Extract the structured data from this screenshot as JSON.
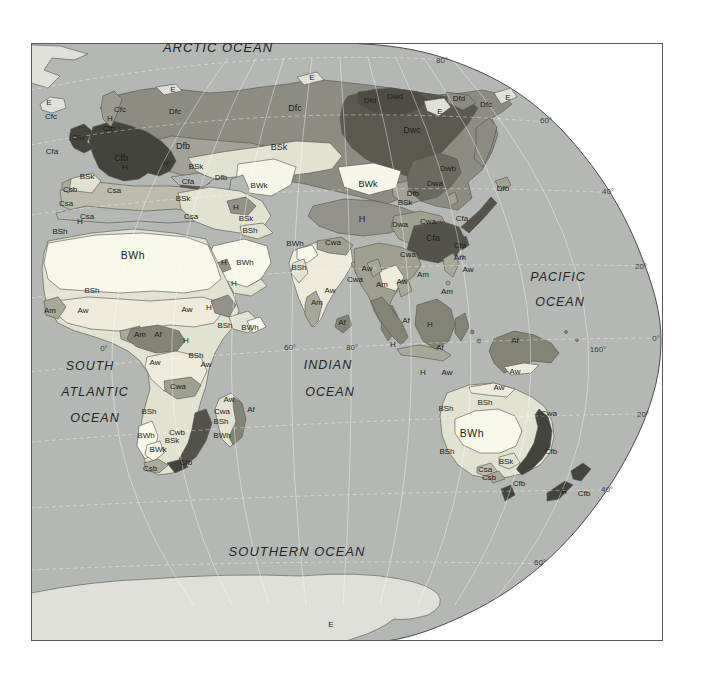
{
  "map": {
    "title_semantic": "Koppen climate classification map, Eastern Hemisphere oval projection",
    "colors": {
      "page_background": "#ffffff",
      "frame_border": "#5a5a5a",
      "graticule": "#ffffff",
      "boundary_line": "#55504a"
    },
    "zone_colors": {
      "ocean": "#b4b8b4",
      "E": "#e0e0da",
      "BWh": "#f7f7ea",
      "BWk": "#f5f5e8",
      "BSh": "#e2e2d0",
      "BSk": "#e2e2d0",
      "Aw": "#eeebdb",
      "Am": "#a8a899",
      "Af": "#848476",
      "Cwa": "#a0a090",
      "Cwb": "#a0a090",
      "Cfa": "#53534b",
      "Cfb": "#44443e",
      "Cfc": "#9a9a8e",
      "Csa": "#bdbcac",
      "Csb": "#acab9b",
      "Dfb": "#a3a299",
      "Dfc": "#8d8c83",
      "Dfd": "#8d8c83",
      "Dwa": "#6c6a60",
      "Dwb": "#6c6a60",
      "Dwc": "#5b594f",
      "Dwd": "#4e4c44",
      "H": "#92928a"
    },
    "ocean_labels": [
      {
        "t": "ARCTIC OCEAN",
        "x": 218,
        "y": 47,
        "size": 13
      },
      {
        "t": "PACIFIC",
        "x": 558,
        "y": 277,
        "size": 12.5
      },
      {
        "t": "OCEAN",
        "x": 560,
        "y": 302,
        "size": 12.5
      },
      {
        "t": "SOUTH",
        "x": 90,
        "y": 366,
        "size": 12.5
      },
      {
        "t": "ATLANTIC",
        "x": 95,
        "y": 392,
        "size": 12.5
      },
      {
        "t": "OCEAN",
        "x": 95,
        "y": 418,
        "size": 12.5
      },
      {
        "t": "INDIAN",
        "x": 328,
        "y": 365,
        "size": 12.5
      },
      {
        "t": "OCEAN",
        "x": 330,
        "y": 392,
        "size": 12.5
      },
      {
        "t": "SOUTHERN OCEAN",
        "x": 297,
        "y": 551,
        "size": 13
      }
    ],
    "graticule_labels": [
      {
        "t": "80°",
        "x": 442,
        "y": 60
      },
      {
        "t": "60°",
        "x": 546,
        "y": 120
      },
      {
        "t": "40°",
        "x": 608,
        "y": 191
      },
      {
        "t": "20°",
        "x": 641,
        "y": 266
      },
      {
        "t": "0°",
        "x": 656,
        "y": 338
      },
      {
        "t": "160°",
        "x": 598,
        "y": 349
      },
      {
        "t": "20°",
        "x": 643,
        "y": 414
      },
      {
        "t": "40°",
        "x": 607,
        "y": 489
      },
      {
        "t": "60°",
        "x": 540,
        "y": 562
      },
      {
        "t": "60°",
        "x": 290,
        "y": 347
      },
      {
        "t": "80°",
        "x": 352,
        "y": 347
      },
      {
        "t": "0°",
        "x": 104,
        "y": 348
      }
    ],
    "climate_labels": [
      {
        "t": "E",
        "x": 49,
        "y": 103
      },
      {
        "t": "Cfc",
        "x": 51,
        "y": 117
      },
      {
        "t": "Cfa",
        "x": 52,
        "y": 152
      },
      {
        "t": "Cfc",
        "x": 120,
        "y": 110
      },
      {
        "t": "H",
        "x": 110,
        "y": 119
      },
      {
        "t": "Cfb",
        "x": 109,
        "y": 129
      },
      {
        "t": "Cfb",
        "x": 78,
        "y": 138
      },
      {
        "t": "Cfb",
        "x": 121,
        "y": 158,
        "s": 2
      },
      {
        "t": "H",
        "x": 125,
        "y": 168
      },
      {
        "t": "H",
        "x": 166,
        "y": 164
      },
      {
        "t": "BSk",
        "x": 87,
        "y": 177
      },
      {
        "t": "Csb",
        "x": 70,
        "y": 190
      },
      {
        "t": "Csa",
        "x": 66,
        "y": 204
      },
      {
        "t": "Csa",
        "x": 114,
        "y": 191
      },
      {
        "t": "Csa",
        "x": 87,
        "y": 217
      },
      {
        "t": "H",
        "x": 80,
        "y": 222
      },
      {
        "t": "BSh",
        "x": 60,
        "y": 232
      },
      {
        "t": "E",
        "x": 173,
        "y": 90
      },
      {
        "t": "Dfc",
        "x": 175,
        "y": 112
      },
      {
        "t": "Dfb",
        "x": 183,
        "y": 146,
        "s": 2
      },
      {
        "t": "BSk",
        "x": 196,
        "y": 167
      },
      {
        "t": "Dfb",
        "x": 221,
        "y": 178
      },
      {
        "t": "Cfa",
        "x": 188,
        "y": 182
      },
      {
        "t": "BSk",
        "x": 183,
        "y": 199
      },
      {
        "t": "Csa",
        "x": 191,
        "y": 217
      },
      {
        "t": "Dfc",
        "x": 295,
        "y": 108,
        "s": 2
      },
      {
        "t": "E",
        "x": 312,
        "y": 78
      },
      {
        "t": "BSk",
        "x": 279,
        "y": 147,
        "s": 2
      },
      {
        "t": "BWk",
        "x": 259,
        "y": 186
      },
      {
        "t": "H",
        "x": 236,
        "y": 208
      },
      {
        "t": "BSk",
        "x": 246,
        "y": 219
      },
      {
        "t": "BSh",
        "x": 250,
        "y": 231
      },
      {
        "t": "Dwd",
        "x": 395,
        "y": 97
      },
      {
        "t": "Dfd",
        "x": 370,
        "y": 101
      },
      {
        "t": "Dfd",
        "x": 459,
        "y": 99
      },
      {
        "t": "Dfc",
        "x": 486,
        "y": 105
      },
      {
        "t": "E",
        "x": 508,
        "y": 98
      },
      {
        "t": "E",
        "x": 440,
        "y": 112
      },
      {
        "t": "Dwc",
        "x": 412,
        "y": 130,
        "s": 2
      },
      {
        "t": "BWk",
        "x": 368,
        "y": 184,
        "s": 2
      },
      {
        "t": "BSk",
        "x": 405,
        "y": 203
      },
      {
        "t": "H",
        "x": 362,
        "y": 219,
        "s": 2
      },
      {
        "t": "Dwb",
        "x": 448,
        "y": 169
      },
      {
        "t": "Dwa",
        "x": 435,
        "y": 184
      },
      {
        "t": "Dfb",
        "x": 413,
        "y": 194
      },
      {
        "t": "Dwa",
        "x": 400,
        "y": 225
      },
      {
        "t": "Cwa",
        "x": 428,
        "y": 222
      },
      {
        "t": "Cfa",
        "x": 433,
        "y": 238,
        "s": 2
      },
      {
        "t": "Dfb",
        "x": 503,
        "y": 189
      },
      {
        "t": "Cfa",
        "x": 462,
        "y": 219
      },
      {
        "t": "Cfa",
        "x": 460,
        "y": 246
      },
      {
        "t": "Am",
        "x": 460,
        "y": 258
      },
      {
        "t": "Aw",
        "x": 468,
        "y": 270
      },
      {
        "t": "BWh",
        "x": 133,
        "y": 255,
        "s": 3
      },
      {
        "t": "H",
        "x": 224,
        "y": 263
      },
      {
        "t": "BWh",
        "x": 245,
        "y": 263
      },
      {
        "t": "H",
        "x": 234,
        "y": 284
      },
      {
        "t": "BSh",
        "x": 92,
        "y": 291
      },
      {
        "t": "Am",
        "x": 50,
        "y": 311
      },
      {
        "t": "Aw",
        "x": 83,
        "y": 311
      },
      {
        "t": "Aw",
        "x": 187,
        "y": 310
      },
      {
        "t": "H",
        "x": 209,
        "y": 308
      },
      {
        "t": "BSh",
        "x": 225,
        "y": 326
      },
      {
        "t": "BWh",
        "x": 250,
        "y": 328
      },
      {
        "t": "Am",
        "x": 140,
        "y": 335
      },
      {
        "t": "Af",
        "x": 158,
        "y": 335
      },
      {
        "t": "H",
        "x": 186,
        "y": 341
      },
      {
        "t": "Aw",
        "x": 155,
        "y": 363
      },
      {
        "t": "BSh",
        "x": 196,
        "y": 356
      },
      {
        "t": "Aw",
        "x": 206,
        "y": 365
      },
      {
        "t": "Cwa",
        "x": 178,
        "y": 387
      },
      {
        "t": "BSh",
        "x": 149,
        "y": 412
      },
      {
        "t": "BWh",
        "x": 146,
        "y": 436
      },
      {
        "t": "Cwb",
        "x": 177,
        "y": 433
      },
      {
        "t": "BSk",
        "x": 172,
        "y": 441
      },
      {
        "t": "BWk",
        "x": 158,
        "y": 450
      },
      {
        "t": "Cfb",
        "x": 186,
        "y": 463
      },
      {
        "t": "Csb",
        "x": 150,
        "y": 469
      },
      {
        "t": "Aw",
        "x": 229,
        "y": 400
      },
      {
        "t": "Cwa",
        "x": 222,
        "y": 412
      },
      {
        "t": "Af",
        "x": 251,
        "y": 410
      },
      {
        "t": "BSh",
        "x": 221,
        "y": 422
      },
      {
        "t": "BWh",
        "x": 222,
        "y": 436
      },
      {
        "t": "BWh",
        "x": 295,
        "y": 244
      },
      {
        "t": "Cwa",
        "x": 333,
        "y": 243
      },
      {
        "t": "BSh",
        "x": 299,
        "y": 268
      },
      {
        "t": "Cwa",
        "x": 355,
        "y": 280
      },
      {
        "t": "Aw",
        "x": 330,
        "y": 291
      },
      {
        "t": "Am",
        "x": 317,
        "y": 303
      },
      {
        "t": "Af",
        "x": 342,
        "y": 323
      },
      {
        "t": "Aw",
        "x": 367,
        "y": 269
      },
      {
        "t": "Cwa",
        "x": 408,
        "y": 255
      },
      {
        "t": "Am",
        "x": 423,
        "y": 275
      },
      {
        "t": "Aw",
        "x": 402,
        "y": 282
      },
      {
        "t": "Am",
        "x": 382,
        "y": 285
      },
      {
        "t": "Am",
        "x": 447,
        "y": 292
      },
      {
        "t": "Af",
        "x": 406,
        "y": 321
      },
      {
        "t": "H",
        "x": 430,
        "y": 325
      },
      {
        "t": "Af",
        "x": 440,
        "y": 348
      },
      {
        "t": "H",
        "x": 393,
        "y": 345
      },
      {
        "t": "H",
        "x": 423,
        "y": 373
      },
      {
        "t": "Aw",
        "x": 447,
        "y": 373
      },
      {
        "t": "Af",
        "x": 515,
        "y": 341
      },
      {
        "t": "Aw",
        "x": 515,
        "y": 372
      },
      {
        "t": "Aw",
        "x": 499,
        "y": 388
      },
      {
        "t": "BSh",
        "x": 485,
        "y": 403
      },
      {
        "t": "BSh",
        "x": 446,
        "y": 409
      },
      {
        "t": "Cwa",
        "x": 549,
        "y": 414
      },
      {
        "t": "BWh",
        "x": 472,
        "y": 433,
        "s": 3
      },
      {
        "t": "BSh",
        "x": 447,
        "y": 452
      },
      {
        "t": "Cfb",
        "x": 551,
        "y": 452
      },
      {
        "t": "BSk",
        "x": 506,
        "y": 462
      },
      {
        "t": "Csa",
        "x": 485,
        "y": 470
      },
      {
        "t": "Csb",
        "x": 489,
        "y": 478
      },
      {
        "t": "Cfb",
        "x": 519,
        "y": 484
      },
      {
        "t": "H",
        "x": 564,
        "y": 492
      },
      {
        "t": "Cfb",
        "x": 584,
        "y": 494
      },
      {
        "t": "E",
        "x": 331,
        "y": 625
      }
    ]
  }
}
